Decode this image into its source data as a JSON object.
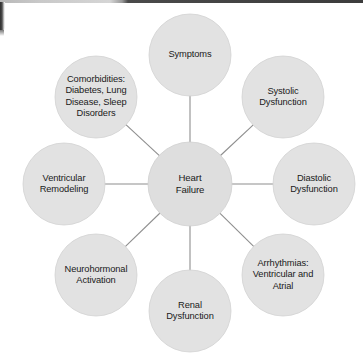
{
  "figure": {
    "type": "radial-concept-map",
    "width": 363,
    "height": 357,
    "background_color": "#ffffff",
    "node_fill_color": "#e2e2e2",
    "node_stroke_color": "#d2d2d2",
    "connector_color": "#8e8e8e",
    "text_color": "#1a1a1a"
  },
  "hub": {
    "id": "heart-failure",
    "label": "Heart\nFailure",
    "cx": 190,
    "cy": 184,
    "r": 42
  },
  "nodes": [
    {
      "id": "symptoms",
      "label": "Symptoms",
      "position": "top",
      "cx": 190,
      "cy": 55,
      "r": 41
    },
    {
      "id": "systolic-dysfunction",
      "label": "Systolic\nDysfunction",
      "position": "top-right",
      "cx": 283,
      "cy": 97,
      "r": 41
    },
    {
      "id": "diastolic-dysfunction",
      "label": "Diastolic\nDysfunction",
      "position": "right",
      "cx": 314,
      "cy": 184,
      "r": 41
    },
    {
      "id": "arrhythmias",
      "label": "Arrhythmias:\nVentricular and\nAtrial",
      "position": "bottom-right",
      "cx": 283,
      "cy": 275,
      "r": 41
    },
    {
      "id": "renal-dysfunction",
      "label": "Renal\nDysfunction",
      "position": "bottom",
      "cx": 190,
      "cy": 311,
      "r": 41
    },
    {
      "id": "neurohormonal-activation",
      "label": "Neurohormonal\nActivation",
      "position": "bottom-left",
      "cx": 96,
      "cy": 275,
      "r": 41
    },
    {
      "id": "ventricular-remodeling",
      "label": "Ventricular\nRemodeling",
      "position": "left",
      "cx": 64,
      "cy": 184,
      "r": 41
    },
    {
      "id": "comorbidities",
      "label": "Comorbidities:\nDiabetes, Lung\nDisease, Sleep\nDisorders",
      "position": "top-left",
      "cx": 96,
      "cy": 97,
      "r": 41
    }
  ],
  "connectors": [
    {
      "from": "heart-failure",
      "to": "symptoms"
    },
    {
      "from": "heart-failure",
      "to": "systolic-dysfunction"
    },
    {
      "from": "heart-failure",
      "to": "diastolic-dysfunction"
    },
    {
      "from": "heart-failure",
      "to": "arrhythmias"
    },
    {
      "from": "heart-failure",
      "to": "renal-dysfunction"
    },
    {
      "from": "heart-failure",
      "to": "neurohormonal-activation"
    },
    {
      "from": "heart-failure",
      "to": "ventricular-remodeling"
    },
    {
      "from": "heart-failure",
      "to": "comorbidities"
    }
  ]
}
